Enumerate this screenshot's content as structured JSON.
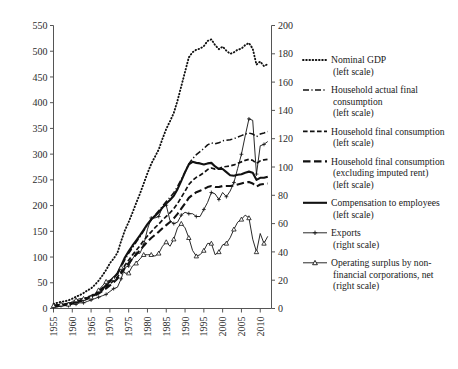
{
  "chart_data": {
    "type": "line",
    "title": "",
    "xlabel": "",
    "ylabel_left": "",
    "ylabel_right": "",
    "grid": false,
    "legend_position": "right",
    "xlim": [
      1955,
      2013
    ],
    "xticks": [
      "1955",
      "1960",
      "1965",
      "1970",
      "1975",
      "1980",
      "1985",
      "1990",
      "1995",
      "2000",
      "2005",
      "2010"
    ],
    "left_axis": {
      "ylim": [
        0,
        550
      ],
      "ticks": [
        "0",
        "50",
        "100",
        "150",
        "200",
        "250",
        "300",
        "350",
        "400",
        "450",
        "500",
        "550"
      ]
    },
    "right_axis": {
      "ylim": [
        0,
        200
      ],
      "ticks": [
        "0",
        "20",
        "40",
        "60",
        "80",
        "100",
        "120",
        "140",
        "160",
        "180",
        "200"
      ]
    },
    "x": [
      1955,
      1956,
      1957,
      1958,
      1959,
      1960,
      1961,
      1962,
      1963,
      1964,
      1965,
      1966,
      1967,
      1968,
      1969,
      1970,
      1971,
      1972,
      1973,
      1974,
      1975,
      1976,
      1977,
      1978,
      1979,
      1980,
      1981,
      1982,
      1983,
      1984,
      1985,
      1986,
      1987,
      1988,
      1989,
      1990,
      1991,
      1992,
      1993,
      1994,
      1995,
      1996,
      1997,
      1998,
      1999,
      2000,
      2001,
      2002,
      2003,
      2004,
      2005,
      2006,
      2007,
      2008,
      2009,
      2010,
      2011,
      2012
    ],
    "series": [
      {
        "name": "Nominal GDP",
        "scale": "left",
        "style": "dotted",
        "legend_label": "Nominal GDP",
        "legend_sub": "(left scale)",
        "values": [
          9,
          11,
          13,
          14,
          16,
          19,
          23,
          26,
          30,
          35,
          39,
          46,
          54,
          64,
          75,
          88,
          97,
          108,
          131,
          152,
          168,
          186,
          205,
          223,
          243,
          263,
          281,
          295,
          309,
          330,
          349,
          364,
          380,
          404,
          432,
          460,
          488,
          498,
          503,
          505,
          510,
          520,
          523,
          512,
          504,
          509,
          501,
          495,
          498,
          503,
          505,
          512,
          516,
          505,
          474,
          480,
          471,
          475
        ]
      },
      {
        "name": "Household actual final consumption",
        "scale": "left",
        "style": "dashdot",
        "legend_label": "Household actual final consumption",
        "legend_sub": "(left scale)",
        "values": [
          6,
          7,
          8,
          9,
          10,
          12,
          14,
          16,
          19,
          22,
          25,
          29,
          34,
          40,
          46,
          53,
          60,
          68,
          81,
          95,
          107,
          118,
          129,
          139,
          151,
          162,
          172,
          181,
          190,
          199,
          208,
          216,
          225,
          237,
          251,
          265,
          281,
          291,
          299,
          305,
          311,
          318,
          322,
          320,
          322,
          326,
          327,
          328,
          330,
          333,
          336,
          339,
          341,
          339,
          334,
          339,
          341,
          344
        ]
      },
      {
        "name": "Household final consumption",
        "scale": "left",
        "style": "dashed-short",
        "legend_label": "Household final consumption",
        "legend_sub": "(left scale)",
        "values": [
          5,
          6,
          7,
          8,
          9,
          11,
          13,
          15,
          17,
          20,
          23,
          26,
          31,
          36,
          42,
          48,
          54,
          61,
          72,
          84,
          94,
          104,
          113,
          122,
          132,
          141,
          149,
          157,
          164,
          172,
          179,
          186,
          194,
          204,
          216,
          228,
          241,
          249,
          255,
          259,
          264,
          270,
          273,
          271,
          272,
          275,
          276,
          277,
          279,
          282,
          285,
          288,
          290,
          288,
          282,
          287,
          289,
          290
        ]
      },
      {
        "name": "Household final consumption (excluding imputed rent)",
        "scale": "left",
        "style": "dashed-long",
        "legend_label": "Household final consumption",
        "legend_sub2": "(excluding imputed rent)",
        "legend_sub": "(left scale)",
        "values": [
          5,
          6,
          7,
          8,
          9,
          10,
          12,
          14,
          16,
          19,
          22,
          25,
          29,
          34,
          39,
          45,
          51,
          58,
          68,
          79,
          88,
          97,
          105,
          113,
          122,
          130,
          137,
          143,
          149,
          156,
          162,
          168,
          175,
          184,
          194,
          204,
          215,
          221,
          226,
          229,
          232,
          236,
          238,
          236,
          236,
          238,
          238,
          238,
          239,
          241,
          243,
          245,
          246,
          243,
          237,
          241,
          242,
          243
        ]
      },
      {
        "name": "Compensation to employees",
        "scale": "left",
        "style": "solid-thick",
        "legend_label": "Compensation to employees",
        "legend_sub": "(left scale)",
        "values": [
          4,
          5,
          6,
          7,
          8,
          10,
          12,
          14,
          17,
          20,
          23,
          27,
          32,
          38,
          45,
          53,
          60,
          68,
          83,
          99,
          111,
          122,
          132,
          142,
          153,
          164,
          173,
          180,
          187,
          196,
          204,
          211,
          219,
          232,
          248,
          265,
          280,
          285,
          283,
          282,
          280,
          282,
          283,
          276,
          271,
          271,
          265,
          259,
          258,
          260,
          261,
          264,
          266,
          264,
          250,
          254,
          254,
          256
        ]
      },
      {
        "name": "Exports",
        "scale": "right",
        "style": "solid-plus",
        "legend_label": "Exports",
        "legend_sub": "(right scale)",
        "values": [
          1,
          1,
          2,
          2,
          2,
          3,
          3,
          4,
          4,
          5,
          6,
          7,
          8,
          9,
          10,
          12,
          14,
          15,
          21,
          29,
          30,
          35,
          39,
          39,
          45,
          56,
          64,
          64,
          65,
          72,
          73,
          62,
          60,
          61,
          66,
          68,
          67,
          67,
          65,
          65,
          70,
          75,
          82,
          81,
          77,
          82,
          79,
          83,
          89,
          99,
          109,
          122,
          134,
          133,
          95,
          115,
          116,
          118
        ]
      },
      {
        "name": "Operating surplus by non-financial corporations, net",
        "scale": "right",
        "style": "solid-triangle",
        "legend_label": "Operating surplus by non-",
        "legend_sub2": "financial corporations, net",
        "legend_sub": "(right scale)",
        "values": [
          2,
          2,
          3,
          3,
          3,
          5,
          6,
          7,
          7,
          8,
          8,
          10,
          13,
          16,
          19,
          20,
          21,
          24,
          29,
          25,
          25,
          30,
          32,
          35,
          38,
          38,
          38,
          37,
          39,
          44,
          47,
          44,
          49,
          57,
          60,
          57,
          50,
          41,
          37,
          38,
          41,
          46,
          46,
          38,
          40,
          45,
          46,
          50,
          56,
          61,
          63,
          66,
          64,
          49,
          40,
          53,
          46,
          51
        ]
      }
    ]
  },
  "legend": {
    "items": [
      {
        "label": "Nominal GDP",
        "sub": "(left scale)",
        "style": "dotted"
      },
      {
        "label": "Household actual final",
        "sub2": "consumption",
        "sub": "(left scale)",
        "style": "dashdot"
      },
      {
        "label": "Household final consumption",
        "sub": "(left scale)",
        "style": "dashed-short"
      },
      {
        "label": "Household final consumption",
        "sub2": "(excluding imputed rent)",
        "sub": "(left scale)",
        "style": "dashed-long"
      },
      {
        "label": "Compensation to employees",
        "sub": "(left scale)",
        "style": "solid-thick"
      },
      {
        "label": "Exports",
        "sub": "(right scale)",
        "style": "solid-plus"
      },
      {
        "label": "Operating surplus by non-",
        "sub2": "financial corporations, net",
        "sub": "(right scale)",
        "style": "solid-triangle"
      }
    ]
  },
  "colors": {
    "line": "#111111",
    "axis": "#555555",
    "text": "#1a1a1a",
    "background": "#ffffff"
  }
}
